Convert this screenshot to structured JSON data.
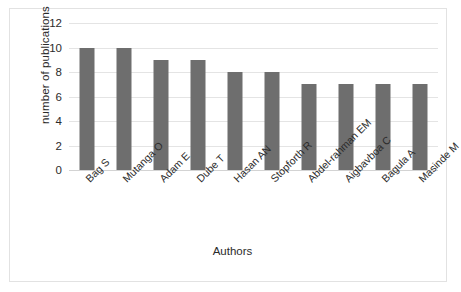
{
  "chart_data": {
    "type": "bar",
    "title": "",
    "xlabel": "Authors",
    "ylabel": "number of publications",
    "categories": [
      "Bag S",
      "Mutanga O",
      "Adam E",
      "Dube T",
      "Hasan AN",
      "Stopforth R",
      "Abdel-rahman EM",
      "Aigbavboa C",
      "Bagula A",
      "Masinde M"
    ],
    "values": [
      10,
      10,
      9,
      9,
      8,
      8,
      7,
      7,
      7,
      7
    ],
    "ylim": [
      0,
      12
    ],
    "yticks": [
      0,
      2,
      4,
      6,
      8,
      10,
      12
    ],
    "ytick_labels": [
      "0",
      "2",
      "4",
      "6",
      "8",
      "10",
      "12"
    ],
    "grid": true,
    "legend": "none",
    "bar_color": "#6e6e6e",
    "gridline_color": "#e4e4e4",
    "plot_background": "#ffffff",
    "border_color": "#e2e2e2"
  }
}
